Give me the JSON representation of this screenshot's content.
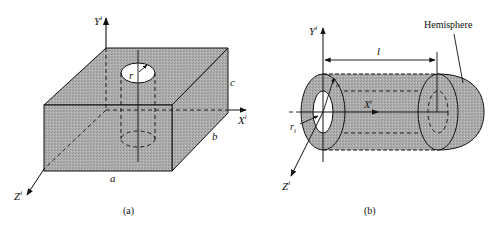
{
  "figure": {
    "colors": {
      "fill": "#a9a9a9",
      "stroke": "#111111",
      "background": "#ffffff"
    },
    "panel_a": {
      "caption": "(a)",
      "labels": {
        "y_axis": "Y",
        "y_sup": "i",
        "x_axis": "X",
        "x_sup": "i",
        "z_axis": "Z",
        "z_sup": "i",
        "radius": "r",
        "width": "a",
        "depth": "b",
        "height": "c"
      },
      "shape": "rectangular block with cylindrical hole"
    },
    "panel_b": {
      "caption": "(b)",
      "labels": {
        "y_axis": "Y",
        "y_sup": "i",
        "x_axis": "X",
        "x_sup": "i",
        "z_axis": "Z",
        "z_sup": "i",
        "outer_radius": "r",
        "outer_sub": "o",
        "inner_radius": "r",
        "inner_sub": "i",
        "length": "l",
        "hemisphere": "Hemisphere"
      },
      "shape": "hollow cylinder with hemispherical end"
    }
  }
}
